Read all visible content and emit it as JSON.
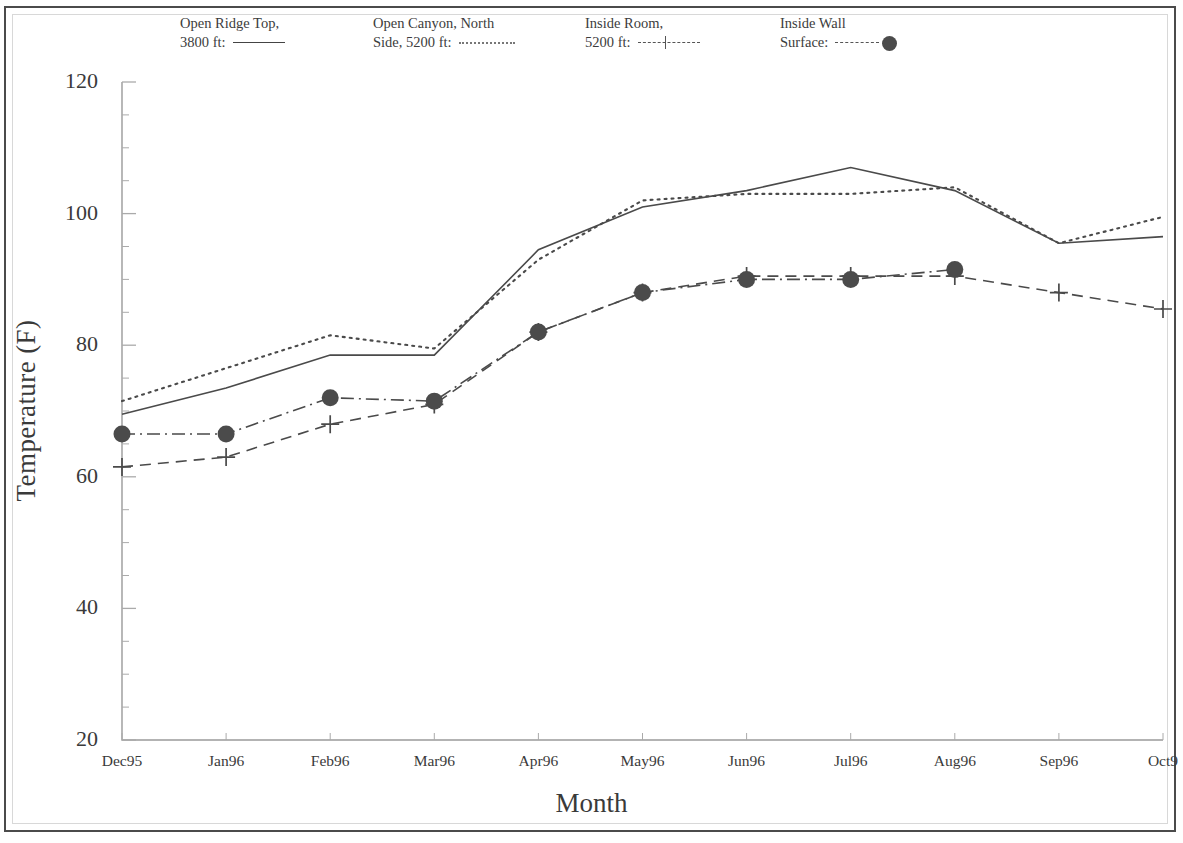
{
  "figure": {
    "background_color": "#ffffff",
    "line_color": "#444444",
    "marker_color": "#4b4b4b"
  },
  "legend": {
    "items": [
      {
        "name": "open-ridge-top",
        "line1": "Open Ridge Top,",
        "line2": "3800 ft:",
        "style": "solid"
      },
      {
        "name": "open-canyon-north-side",
        "line1": "Open Canyon, North",
        "line2": "Side, 5200 ft:",
        "style": "dotted"
      },
      {
        "name": "inside-room",
        "line1": "Inside Room,",
        "line2": "5200 ft:",
        "style": "dash-plus"
      },
      {
        "name": "inside-wall-surface",
        "line1": "Inside Wall",
        "line2": "Surface:",
        "style": "dash-circle"
      }
    ]
  },
  "chart_data": {
    "type": "line",
    "title": "",
    "xlabel": "Month",
    "ylabel": "Temperature (F)",
    "ylim": [
      20,
      120
    ],
    "ytick_labels": [
      "120",
      "100",
      "80",
      "60",
      "40",
      "20"
    ],
    "ytick_values": [
      120,
      100,
      80,
      60,
      40,
      20
    ],
    "yminor_step": 5,
    "grid": false,
    "legend_position": "top",
    "categories": [
      "Dec95",
      "Jan96",
      "Feb96",
      "Mar96",
      "Apr96",
      "May96",
      "Jun96",
      "Jul96",
      "Aug96",
      "Sep96",
      "Oct9"
    ],
    "x_last_label_truncated": true,
    "series": [
      {
        "name": "Open Ridge Top, 3800 ft",
        "style": "solid",
        "marker": "none",
        "values": [
          69.5,
          73.5,
          78.5,
          78.5,
          94.5,
          101.0,
          103.5,
          107.0,
          103.5,
          95.5,
          96.5
        ]
      },
      {
        "name": "Open Canyon, North Side, 5200 ft",
        "style": "dotted",
        "marker": "none",
        "values": [
          71.5,
          76.5,
          81.5,
          79.5,
          93.0,
          102.0,
          103.0,
          103.0,
          104.0,
          95.5,
          99.5
        ]
      },
      {
        "name": "Inside Room, 5200 ft",
        "style": "dashed",
        "marker": "plus",
        "values": [
          61.5,
          63.0,
          68.0,
          71.0,
          82.0,
          88.0,
          90.5,
          90.5,
          90.5,
          88.0,
          85.5
        ]
      },
      {
        "name": "Inside Wall Surface",
        "style": "dash-dot",
        "marker": "circle",
        "values": [
          66.5,
          66.5,
          72.0,
          71.5,
          82.0,
          88.0,
          90.0,
          90.0,
          91.5,
          null,
          null
        ]
      }
    ]
  },
  "axes": {
    "x_title": "Month",
    "y_title": "Temperature (F)"
  }
}
